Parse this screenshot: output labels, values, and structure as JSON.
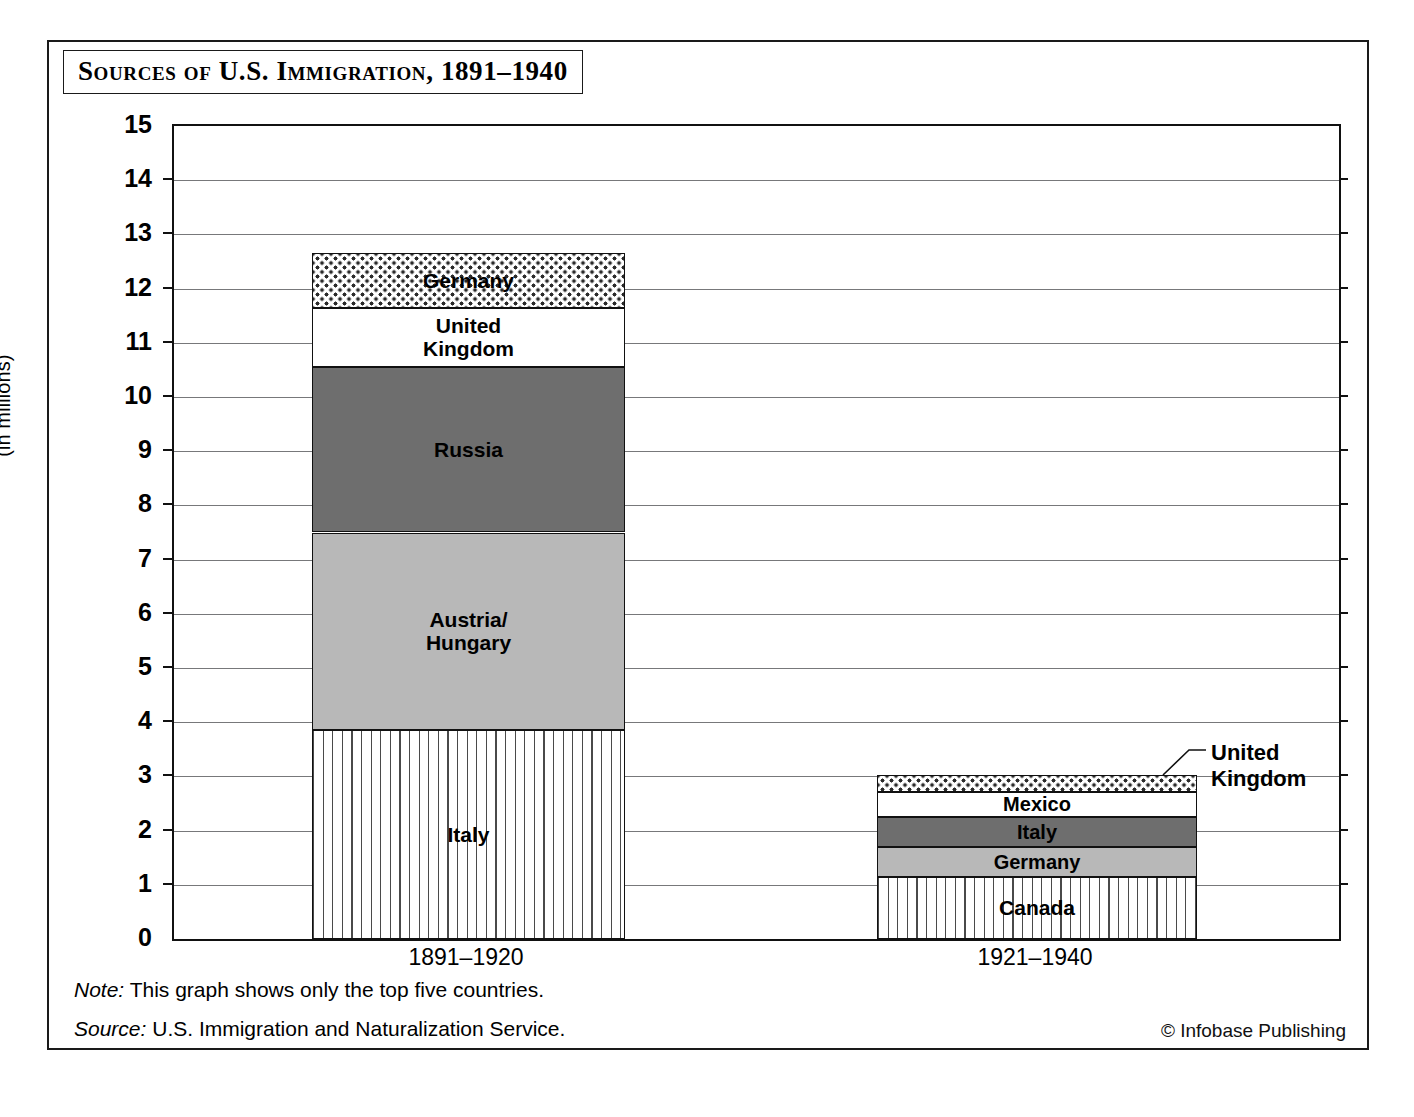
{
  "title": "Sources of U.S. Immigration, 1891–1940",
  "axes": {
    "y_title_line1": "Number of Immigrants",
    "y_title_line2": "(in millions)",
    "y_ticks": [
      "0",
      "1",
      "2",
      "3",
      "4",
      "5",
      "6",
      "7",
      "8",
      "9",
      "10",
      "11",
      "12",
      "13",
      "14",
      "15"
    ]
  },
  "callout": {
    "uk_label": "United\nKingdom"
  },
  "footer": {
    "note_lead": "Note:",
    "note_text": " This graph shows only the top five countries.",
    "source_lead": "Source:",
    "source_text": " U.S. Immigration and Naturalization Service.",
    "credit": "© Infobase Publishing"
  },
  "chart_data": {
    "type": "bar",
    "subtype": "stacked",
    "title": "Sources of U.S. Immigration, 1891–1940",
    "xlabel": "",
    "ylabel": "Number of Immigrants (in millions)",
    "ylim": [
      0,
      15
    ],
    "ytick_step": 1,
    "grid": true,
    "legend": "none (segments labeled in place)",
    "categories": [
      "1891–1920",
      "1921–1940"
    ],
    "columns": [
      {
        "category": "1891–1920",
        "total": 12.65,
        "segments": [
          {
            "label": "Italy",
            "value": 3.85,
            "y0": 0.0,
            "y1": 3.85,
            "fill": "vertical-lines",
            "color": "#ffffff"
          },
          {
            "label": "Austria/\nHungary",
            "value": 3.65,
            "y0": 3.85,
            "y1": 7.5,
            "fill": "light-gray",
            "color": "#b8b8b8"
          },
          {
            "label": "Russia",
            "value": 3.05,
            "y0": 7.5,
            "y1": 10.55,
            "fill": "dark-gray",
            "color": "#6e6e6e"
          },
          {
            "label": "United\nKingdom",
            "value": 1.1,
            "y0": 10.55,
            "y1": 11.65,
            "fill": "white",
            "color": "#ffffff"
          },
          {
            "label": "Germany",
            "value": 1.0,
            "y0": 11.65,
            "y1": 12.65,
            "fill": "stipple",
            "color": "#ffffff"
          }
        ]
      },
      {
        "category": "1921–1940",
        "total": 3.02,
        "segments": [
          {
            "label": "Canada",
            "value": 1.15,
            "y0": 0.0,
            "y1": 1.15,
            "fill": "vertical-lines",
            "color": "#ffffff"
          },
          {
            "label": "Germany",
            "value": 0.55,
            "y0": 1.15,
            "y1": 1.7,
            "fill": "light-gray",
            "color": "#b8b8b8"
          },
          {
            "label": "Italy",
            "value": 0.55,
            "y0": 1.7,
            "y1": 2.25,
            "fill": "dark-gray",
            "color": "#6e6e6e"
          },
          {
            "label": "Mexico",
            "value": 0.47,
            "y0": 2.25,
            "y1": 2.72,
            "fill": "white",
            "color": "#ffffff"
          },
          {
            "label": "United\nKingdom",
            "value": 0.3,
            "y0": 2.72,
            "y1": 3.02,
            "fill": "stipple",
            "color": "#ffffff",
            "label_placement": "external-right-callout"
          }
        ]
      }
    ],
    "notes": [
      "Note: This graph shows only the top five countries.",
      "Source: U.S. Immigration and Naturalization Service."
    ]
  }
}
